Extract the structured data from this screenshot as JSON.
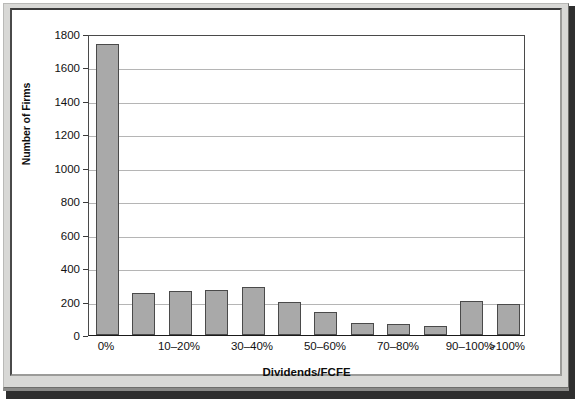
{
  "chart_data": {
    "type": "bar",
    "title": "",
    "xlabel": "Dividends/FCFE",
    "ylabel": "Number of Firms",
    "categories": [
      "0%",
      "0–10%",
      "10–20%",
      "20–30%",
      "30–40%",
      "40–50%",
      "50–60%",
      "60–70%",
      "70–80%",
      "80–90%",
      "90–100%",
      ">100%"
    ],
    "values": [
      1740,
      250,
      265,
      270,
      290,
      195,
      135,
      70,
      65,
      55,
      205,
      185
    ],
    "ylim": [
      0,
      1800
    ],
    "yticks": [
      0,
      200,
      400,
      600,
      800,
      1000,
      1200,
      1400,
      1600,
      1800
    ],
    "ytick_labels": [
      "0",
      "200",
      "400",
      "600",
      "800",
      "1000",
      "1200",
      "1400",
      "1600",
      "1800"
    ],
    "visible_xtick_labels": [
      "0%",
      "10–20%",
      "30–40%",
      "50–60%",
      "70–80%",
      "90–100%",
      ">100%"
    ],
    "visible_xtick_indices": [
      0,
      2,
      4,
      6,
      8,
      10,
      11
    ],
    "grid": "horizontal",
    "legend": "none",
    "bar_fill_color": "#a9a9a9",
    "bar_edge_color": "#4a4a4a",
    "gridline_color": "#b5b5b5",
    "plot_background": "#ffffff",
    "frame_color": "#d8d8d6"
  }
}
